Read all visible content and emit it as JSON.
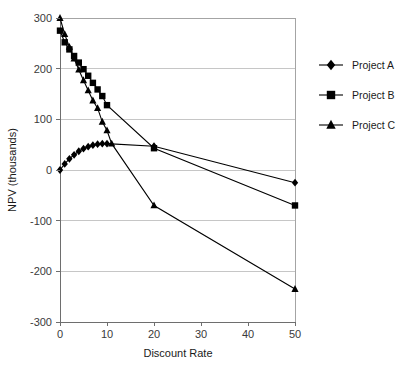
{
  "chart_data": {
    "type": "line",
    "title": "",
    "xlabel": "Discount Rate",
    "ylabel": "NPV (thousands)",
    "xlim": [
      0,
      50
    ],
    "ylim": [
      -300,
      300
    ],
    "xticks": [
      0,
      10,
      20,
      30,
      40,
      50
    ],
    "xticklabels": [
      "0",
      "10",
      "20",
      "30",
      "40",
      "50"
    ],
    "yticks": [
      -300,
      -200,
      -100,
      0,
      100,
      200,
      300
    ],
    "yticklabels": [
      "-300",
      "-200",
      "-100",
      "0",
      "100",
      "200",
      "300"
    ],
    "grid": "horizontal",
    "legend_position": "right",
    "series": [
      {
        "name": "Project A",
        "marker": "diamond",
        "color": "#000000",
        "x": [
          0,
          1,
          2,
          3,
          4,
          5,
          6,
          7,
          8,
          9,
          10,
          20,
          50
        ],
        "y": [
          0,
          12,
          22,
          30,
          37,
          42,
          46,
          49,
          51,
          52,
          52,
          47,
          -25
        ]
      },
      {
        "name": "Project B",
        "marker": "square",
        "color": "#000000",
        "x": [
          0,
          1,
          2,
          3,
          4,
          5,
          6,
          7,
          8,
          9,
          10,
          20,
          50
        ],
        "y": [
          275,
          252,
          238,
          225,
          212,
          199,
          186,
          172,
          159,
          146,
          128,
          43,
          -70
        ]
      },
      {
        "name": "Project C",
        "marker": "triangle",
        "color": "#000000",
        "x": [
          0,
          1,
          2,
          3,
          4,
          5,
          6,
          7,
          8,
          9,
          10,
          11,
          20,
          50
        ],
        "y": [
          300,
          268,
          243,
          220,
          198,
          177,
          157,
          137,
          122,
          95,
          78,
          52,
          -70,
          -235
        ]
      }
    ]
  },
  "legend": {
    "items": [
      {
        "label": "Project A",
        "marker": "diamond"
      },
      {
        "label": "Project B",
        "marker": "square"
      },
      {
        "label": "Project C",
        "marker": "triangle"
      }
    ]
  },
  "axes": {
    "x_title": "Discount Rate",
    "y_title": "NPV (thousands)"
  }
}
